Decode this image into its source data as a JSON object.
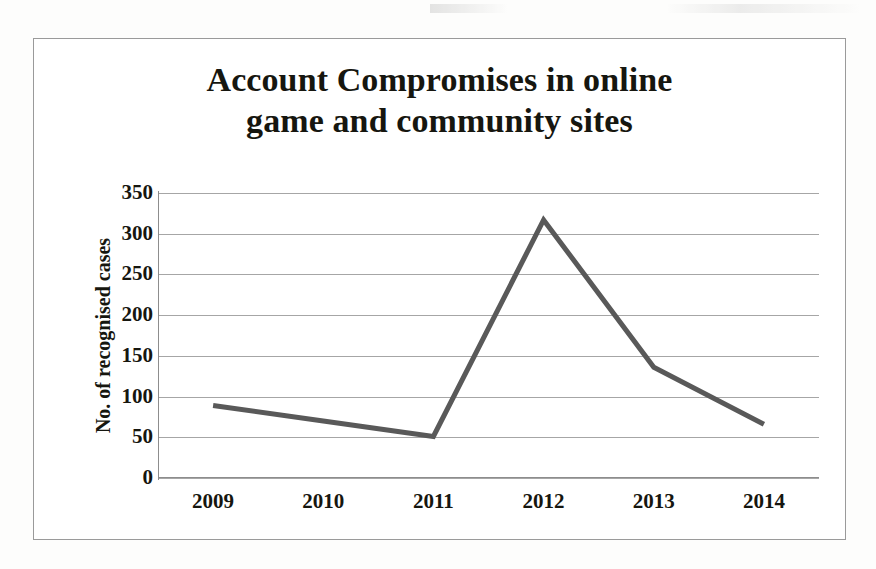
{
  "chart_data": {
    "type": "line",
    "title": "Account Compromises in online game and community sites",
    "title_lines": [
      "Account Compromises in online",
      "game and community sites"
    ],
    "xlabel": "",
    "ylabel": "No. of recognised cases",
    "categories": [
      "2009",
      "2010",
      "2011",
      "2012",
      "2013",
      "2014"
    ],
    "x": [
      2009,
      2010,
      2011,
      2012,
      2013,
      2014
    ],
    "values": [
      89,
      70,
      51,
      317,
      136,
      66
    ],
    "series": [
      {
        "name": "No. of recognised cases",
        "values": [
          89,
          70,
          51,
          317,
          136,
          66
        ],
        "color": "#595959"
      }
    ],
    "ylim": [
      0,
      350
    ],
    "ytick_values": [
      0,
      50,
      100,
      150,
      200,
      250,
      300,
      350
    ],
    "ytick_labels": [
      "0",
      "50",
      "100",
      "150",
      "200",
      "250",
      "300",
      "350"
    ],
    "grid": true,
    "grid_axis": "y",
    "legend": false,
    "legend_position": "none",
    "markers": false,
    "line_width_px": 5,
    "colors": {
      "line": "#595959",
      "grid": "#a6a6a6",
      "axis": "#8d8d8d",
      "frame_border": "#9a9a9a",
      "text": "#16160f",
      "background": "#ffffff"
    }
  }
}
